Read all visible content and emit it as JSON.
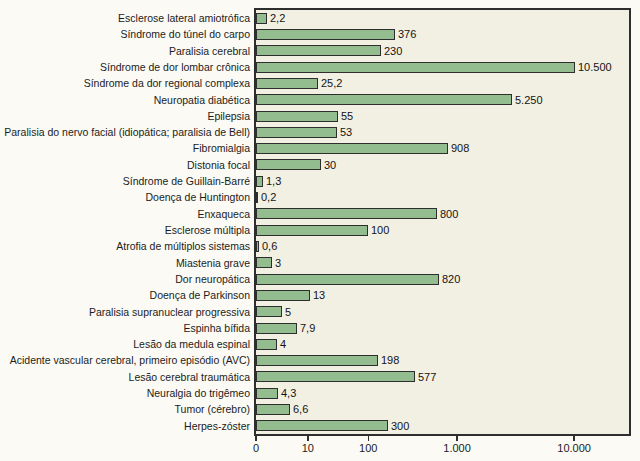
{
  "figure": {
    "background": "#fbfaf4",
    "plot_background": "#f2efe3",
    "bar_fill": "#93bd8e",
    "bar_border": "#2e2e2e",
    "axis_color": "#2e2e2e",
    "text_color": "#1c1c1c"
  },
  "chart_data": {
    "type": "bar",
    "orientation": "horizontal",
    "title": "",
    "xlabel": "",
    "ylabel": "",
    "x_scale": "quasi-log, each decade linearly subdivided",
    "xlim": [
      0,
      20000
    ],
    "grid": false,
    "legend": false,
    "categories": [
      "Esclerose lateral amiotrófica",
      "Síndrome do túnel do carpo",
      "Paralisia cerebral",
      "Síndrome de dor lombar crônica",
      "Síndrome da dor regional complexa",
      "Neuropatia diabética",
      "Epilepsia",
      "Paralisia do nervo facial (idiopática; paralisia de Bell)",
      "Fibromialgia",
      "Distonia focal",
      "Síndrome de Guillain-Barré",
      "Doença de Huntington",
      "Enxaqueca",
      "Esclerose múltipla",
      "Atrofia de múltiplos sistemas",
      "Miastenia grave",
      "Dor neuropática",
      "Doença de Parkinson",
      "Paralisia supranuclear progressiva",
      "Espinha bífida",
      "Lesão da medula espinal",
      "Acidente vascular cerebral, primeiro episódio (AVC)",
      "Lesão cerebral traumática",
      "Neuralgia do trigêmeo",
      "Tumor (cérebro)",
      "Herpes-zóster"
    ],
    "values": [
      2.2,
      376,
      230,
      10500,
      25.2,
      5250,
      55,
      53,
      908,
      30,
      1.3,
      0.2,
      800,
      100,
      0.6,
      3,
      820,
      13,
      5,
      7.9,
      4,
      198,
      577,
      4.3,
      6.6,
      300
    ],
    "value_labels": [
      "2,2",
      "376",
      "230",
      "10.500",
      "25,2",
      "5.250",
      "55",
      "53",
      "908",
      "30",
      "1,3",
      "0,2",
      "800",
      "100",
      "0,6",
      "3",
      "820",
      "13",
      "5",
      "7,9",
      "4",
      "198",
      "577",
      "4,3",
      "6,6",
      "300"
    ],
    "xticks": [
      {
        "label": "0",
        "value": 0,
        "frac": 0.0
      },
      {
        "label": "10",
        "value": 10,
        "frac": 0.139
      },
      {
        "label": "100",
        "value": 100,
        "frac": 0.301
      },
      {
        "label": "1.000",
        "value": 1000,
        "frac": 0.539
      },
      {
        "label": "10.000",
        "value": 10000,
        "frac": 0.853
      }
    ],
    "scale_breakpoints": {
      "values": [
        0,
        10,
        100,
        1000,
        10000,
        100000
      ],
      "fracs": [
        0.0,
        0.139,
        0.301,
        0.539,
        0.853,
        1.167
      ]
    }
  }
}
